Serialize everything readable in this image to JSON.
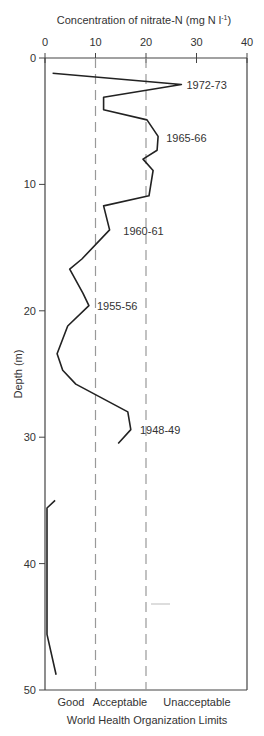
{
  "chart_data": {
    "type": "line",
    "title": "",
    "xlabel": "Concentration of nitrate-N (mg N l⁻¹)",
    "ylabel": "Depth (m)",
    "x_axis_position": "top",
    "y_axis_inverted": true,
    "xlim": [
      0,
      40
    ],
    "ylim": [
      0,
      50
    ],
    "x_ticks": [
      0,
      10,
      20,
      30,
      40
    ],
    "y_ticks": [
      0,
      10,
      20,
      30,
      40,
      50
    ],
    "grid": false,
    "reference_lines": [
      {
        "x": 10,
        "style": "dashed",
        "meaning": "Good / Acceptable boundary"
      },
      {
        "x": 20,
        "style": "dashed",
        "meaning": "Acceptable / Unacceptable boundary"
      }
    ],
    "bottom_zone_labels": [
      "Good",
      "Acceptable",
      "Unacceptable"
    ],
    "bottom_caption": "World Health Organization Limits",
    "series": [
      {
        "name": "Nitrate profile (upper)",
        "points": [
          [
            1.5,
            1.2
          ],
          [
            27,
            2.1
          ],
          [
            11.6,
            3.1
          ],
          [
            11.6,
            4.1
          ],
          [
            20.2,
            4.9
          ],
          [
            22.4,
            6.2
          ],
          [
            22.2,
            7.3
          ],
          [
            19.4,
            8.0
          ],
          [
            21.4,
            8.9
          ],
          [
            20.6,
            10.9
          ],
          [
            11.6,
            11.7
          ],
          [
            12.8,
            13.6
          ],
          [
            7.3,
            15.9
          ],
          [
            4.9,
            16.7
          ],
          [
            7.5,
            18.6
          ],
          [
            8.7,
            19.6
          ],
          [
            4.5,
            21.2
          ],
          [
            2.4,
            23.4
          ],
          [
            3.5,
            24.7
          ],
          [
            6.1,
            25.8
          ],
          [
            16.4,
            28.0
          ],
          [
            17.0,
            29.4
          ],
          [
            14.5,
            30.5
          ]
        ]
      },
      {
        "name": "Nitrate profile (lower)",
        "points": [
          [
            2.0,
            35.0
          ],
          [
            0.4,
            35.6
          ],
          [
            0.4,
            45.6
          ],
          [
            2.2,
            48.8
          ]
        ]
      }
    ],
    "annotations": [
      {
        "text": "1972-73",
        "x": 28,
        "depth": 2.1
      },
      {
        "text": "1965-66",
        "x": 24,
        "depth": 6.3
      },
      {
        "text": "1960-61",
        "x": 15.5,
        "depth": 13.7
      },
      {
        "text": "1955-56",
        "x": 10.3,
        "depth": 19.6
      },
      {
        "text": "1948-49",
        "x": 18.8,
        "depth": 29.4
      }
    ]
  },
  "labels": {
    "x_title": "Concentration of nitrate-N (mg N l",
    "x_title_sup": "-1",
    "x_title_end": ")",
    "y_title": "Depth (m)",
    "zone_good": "Good",
    "zone_acceptable": "Acceptable",
    "zone_unacceptable": "Unacceptable",
    "caption": "World Health Organization Limits"
  }
}
